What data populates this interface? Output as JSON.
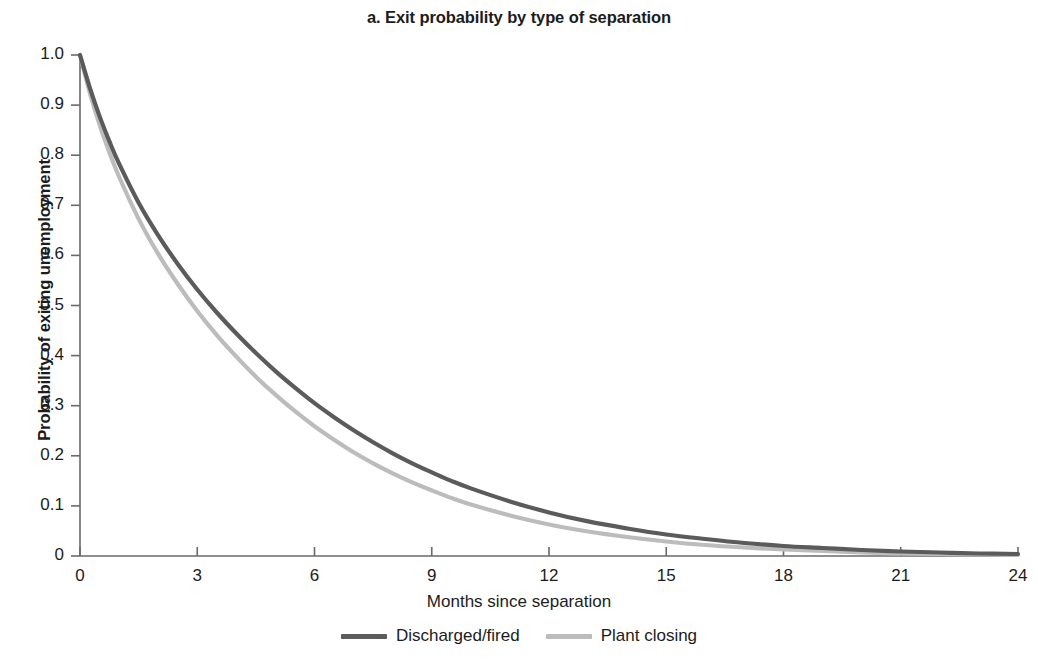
{
  "chart_data": {
    "type": "line",
    "title": "a. Exit probability by type of separation",
    "xlabel": "Months since separation",
    "ylabel": "Probability of exiting unemployment",
    "xlim": [
      0,
      24
    ],
    "ylim": [
      0,
      1.0
    ],
    "grid": false,
    "legend_position": "bottom",
    "xticks": [
      "0",
      "3",
      "6",
      "9",
      "12",
      "15",
      "18",
      "21",
      "24"
    ],
    "xtick_values": [
      0,
      3,
      6,
      9,
      12,
      15,
      18,
      21,
      24
    ],
    "yticks": [
      "0",
      "0.1",
      "0.2",
      "0.3",
      "0.4",
      "0.5",
      "0.6",
      "0.7",
      "0.8",
      "0.9",
      "1.0"
    ],
    "ytick_values": [
      0,
      0.1,
      0.2,
      0.3,
      0.4,
      0.5,
      0.6,
      0.7,
      0.8,
      0.9,
      1.0
    ],
    "x": [
      0,
      0.25,
      0.5,
      0.75,
      1,
      1.5,
      2,
      2.5,
      3,
      3.5,
      4,
      4.5,
      5,
      5.5,
      6,
      6.5,
      7,
      7.5,
      8,
      8.5,
      9,
      9.5,
      10,
      11,
      12,
      13,
      14,
      15,
      16,
      17,
      18,
      19,
      20,
      21,
      22,
      23,
      24
    ],
    "series": [
      {
        "name": "Discharged/fired",
        "color": "#5b5b5b",
        "values": [
          1.0,
          0.935,
          0.878,
          0.828,
          0.783,
          0.705,
          0.64,
          0.583,
          0.532,
          0.486,
          0.444,
          0.405,
          0.369,
          0.336,
          0.305,
          0.277,
          0.251,
          0.227,
          0.205,
          0.185,
          0.167,
          0.15,
          0.135,
          0.109,
          0.087,
          0.069,
          0.055,
          0.043,
          0.034,
          0.026,
          0.02,
          0.016,
          0.012,
          0.009,
          0.007,
          0.005,
          0.004
        ]
      },
      {
        "name": "Plant closing",
        "color": "#bcbcbc",
        "values": [
          1.0,
          0.925,
          0.861,
          0.806,
          0.757,
          0.673,
          0.603,
          0.543,
          0.489,
          0.441,
          0.398,
          0.358,
          0.322,
          0.289,
          0.259,
          0.232,
          0.207,
          0.185,
          0.165,
          0.147,
          0.131,
          0.116,
          0.103,
          0.081,
          0.063,
          0.049,
          0.038,
          0.029,
          0.022,
          0.017,
          0.013,
          0.01,
          0.007,
          0.005,
          0.004,
          0.003,
          0.002
        ]
      }
    ]
  },
  "legend": {
    "items": [
      {
        "label": "Discharged/fired",
        "color": "#5b5b5b"
      },
      {
        "label": "Plant closing",
        "color": "#bcbcbc"
      }
    ]
  },
  "axis_colors": {
    "axis_line": "#6a6a6a",
    "text": "#1c1c1c"
  }
}
